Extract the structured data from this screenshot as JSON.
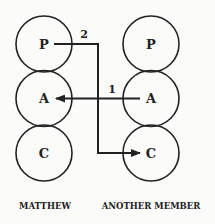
{
  "diagram": {
    "columns": [
      {
        "name": "MATTHEW",
        "states": [
          {
            "label": "P"
          },
          {
            "label": "A"
          },
          {
            "label": "C"
          }
        ]
      },
      {
        "name": "ANOTHER MEMBER",
        "states": [
          {
            "label": "P"
          },
          {
            "label": "A"
          },
          {
            "label": "C"
          }
        ]
      }
    ],
    "transactions": [
      {
        "number": "1",
        "from": "ANOTHER MEMBER A",
        "to": "MATTHEW A"
      },
      {
        "number": "2",
        "from": "MATTHEW P",
        "to": "ANOTHER MEMBER C"
      }
    ]
  }
}
